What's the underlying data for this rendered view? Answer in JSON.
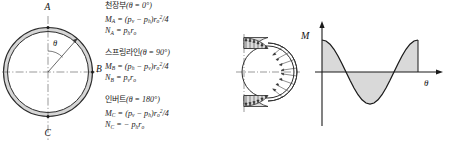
{
  "figure": {
    "stroke_color": "#2b2b2b",
    "ring_fill": "#d4d4d4",
    "shade_fill": "#d9d9d9",
    "background": "#ffffff"
  },
  "ring_diagram": {
    "name": "circular-ring-section",
    "labels": {
      "crown": "A",
      "spring": "B",
      "invert": "C",
      "angle": "θ"
    },
    "axes": {
      "vertical_centerline": "dash-dot",
      "horizontal_centerline": "dash-dot"
    }
  },
  "formulas": {
    "crown": {
      "name": "crown-formula-block",
      "heading_kr": "천장부",
      "heading_condition": "(θ = 0°)",
      "moment_symbol": "M",
      "moment_sub": "A",
      "moment_expr": " = (p",
      "moment_p1_sub": "v",
      "moment_minus": " − p",
      "moment_p2_sub": "h",
      "moment_tail": ")r",
      "moment_r_sub": "o",
      "moment_r_sup": "2",
      "moment_div": "/4",
      "axial_symbol": "N",
      "axial_sub": "A",
      "axial_expr": " = p",
      "axial_p_sub": "h",
      "axial_r": "r",
      "axial_r_sub": "o"
    },
    "spring": {
      "name": "spring-line-formula-block",
      "heading_kr": "스프링라인",
      "heading_condition": "(θ = 90°)",
      "moment_symbol": "M",
      "moment_sub": "B",
      "moment_expr": " = (p",
      "moment_p1_sub": "h",
      "moment_minus": " − p",
      "moment_p2_sub": "v",
      "moment_tail": ")r",
      "moment_r_sub": "o",
      "moment_r_sup": "2",
      "moment_div": "/4",
      "axial_symbol": "N",
      "axial_sub": "B",
      "axial_expr": " = p",
      "axial_p_sub": "v",
      "axial_r": "r",
      "axial_r_sub": "o"
    },
    "invert": {
      "name": "invert-formula-block",
      "heading_kr": "인버트",
      "heading_condition": "(θ = 180°)",
      "moment_symbol": "M",
      "moment_sub": "C",
      "moment_expr": " = (p",
      "moment_p1_sub": "v",
      "moment_minus": " − p",
      "moment_p2_sub": "h",
      "moment_tail": ")r",
      "moment_r_sub": "o",
      "moment_r_sup": "2",
      "moment_div": "/4",
      "axial_symbol": "N",
      "axial_sub": "C",
      "axial_expr": " = − p",
      "axial_p_sub": "h",
      "axial_r": "r",
      "axial_r_sub": "o"
    }
  },
  "pressure_diagram": {
    "name": "radial-pressure-distribution",
    "description": "Radial pressure distribution around lining with hatched arrow loading",
    "centerline": "dash-dot"
  },
  "chart_data": {
    "type": "line",
    "title": "",
    "xlabel": "θ",
    "ylabel": "M",
    "axis_label_moment": "M",
    "axis_label_theta": "θ",
    "grid": false,
    "legend": null,
    "xlim": [
      0,
      360
    ],
    "ylim": [
      -1.15,
      1.15
    ],
    "x": [
      0,
      15,
      30,
      45,
      60,
      75,
      90,
      105,
      120,
      135,
      150,
      165,
      180,
      195,
      210,
      225,
      240,
      255,
      270,
      285,
      300,
      315,
      330,
      345,
      360
    ],
    "series": [
      {
        "name": "M(θ)",
        "values": [
          1.0,
          0.97,
          0.87,
          0.71,
          0.5,
          0.26,
          0.0,
          -0.26,
          -0.5,
          -0.71,
          -0.87,
          -0.97,
          -1.0,
          -0.97,
          -0.87,
          -0.71,
          -0.5,
          -0.26,
          0.0,
          0.26,
          0.5,
          0.71,
          0.87,
          0.97,
          1.0
        ]
      }
    ],
    "annotations": [
      {
        "text": "M",
        "role": "y-axis-label"
      },
      {
        "text": "θ",
        "role": "x-axis-label"
      }
    ],
    "fill_between_zero": true,
    "fill_color": "#d9d9d9"
  }
}
